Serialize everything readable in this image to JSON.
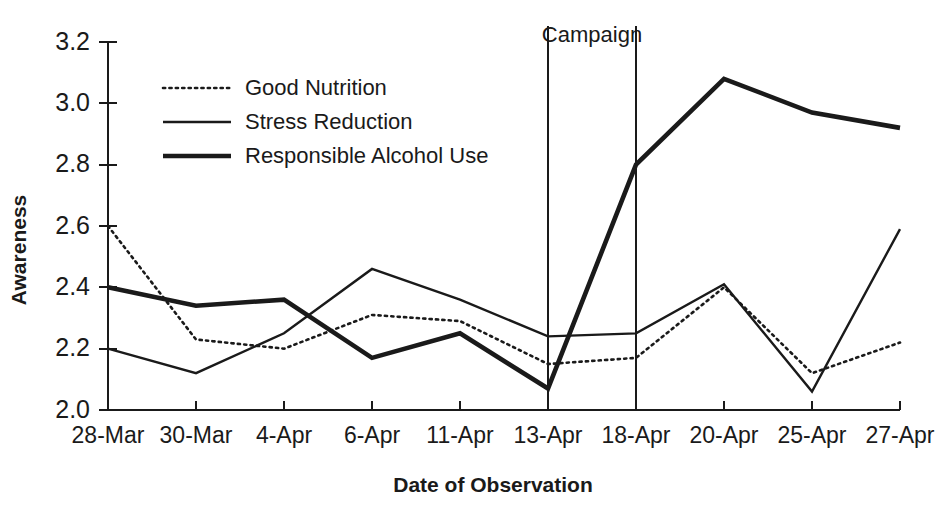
{
  "chart_data": {
    "type": "line",
    "title": "",
    "xlabel": "Date of Observation",
    "ylabel": "Awareness",
    "categories": [
      "28-Mar",
      "30-Mar",
      "4-Apr",
      "6-Apr",
      "11-Apr",
      "13-Apr",
      "18-Apr",
      "20-Apr",
      "25-Apr",
      "27-Apr"
    ],
    "ylim": [
      2.0,
      3.2
    ],
    "yticks": [
      "2.0",
      "2.2",
      "2.4",
      "2.6",
      "2.8",
      "3.0",
      "3.2"
    ],
    "ytick_values": [
      2.0,
      2.2,
      2.4,
      2.6,
      2.8,
      3.0,
      3.2
    ],
    "grid": false,
    "legend_position": "top-left-inside",
    "series": [
      {
        "name": "Good Nutrition",
        "style": "dotted",
        "values": [
          2.6,
          2.23,
          2.2,
          2.31,
          2.29,
          2.15,
          2.17,
          2.4,
          2.12,
          2.22
        ]
      },
      {
        "name": "Stress Reduction",
        "style": "thin",
        "values": [
          2.2,
          2.12,
          2.25,
          2.46,
          2.36,
          2.24,
          2.25,
          2.41,
          2.06,
          2.59
        ]
      },
      {
        "name": "Responsible Alcohol Use",
        "style": "thick",
        "values": [
          2.4,
          2.34,
          2.36,
          2.17,
          2.25,
          2.07,
          2.8,
          3.08,
          2.97,
          2.92
        ]
      }
    ],
    "annotations": [
      {
        "label": "Campaign",
        "type": "span-between-vertical-lines",
        "start_category": "13-Apr",
        "end_category": "18-Apr"
      }
    ],
    "colors": {
      "ink": "#1a1a1a",
      "background": "#ffffff"
    }
  }
}
